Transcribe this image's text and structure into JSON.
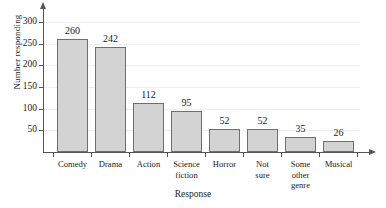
{
  "chart_data": {
    "type": "bar",
    "title": "",
    "xlabel": "Response",
    "ylabel": "Number responding",
    "categories": [
      "Comedy",
      "Drama",
      "Action",
      "Science fiction",
      "Horror",
      "Not sure",
      "Some other genre",
      "Musical"
    ],
    "values": [
      260,
      242,
      112,
      95,
      52,
      52,
      35,
      26
    ],
    "value_labels": [
      "260",
      "242",
      "112",
      "95",
      "52",
      "52",
      "35",
      "26"
    ],
    "ylim": [
      0,
      320
    ],
    "yticks": [
      50,
      100,
      150,
      200,
      250,
      300
    ],
    "ytick_labels": [
      "50",
      "100",
      "150",
      "200",
      "250",
      "300"
    ],
    "grid": true,
    "legend": null,
    "colors": {
      "bar_fill": "#d3d3d3",
      "bar_edge": "#6e6e6e",
      "axis": "#555555",
      "gridline": "#efefef",
      "text": "#1a1a1a",
      "background": "#ffffff"
    }
  },
  "axes": {
    "y_title": "Number responding",
    "x_title": "Response"
  },
  "category_label_lines": [
    [
      "Comedy"
    ],
    [
      "Drama"
    ],
    [
      "Action"
    ],
    [
      "Science",
      "fiction"
    ],
    [
      "Horror"
    ],
    [
      "Not",
      "sure"
    ],
    [
      "Some",
      "other",
      "genre"
    ],
    [
      "Musical"
    ]
  ]
}
